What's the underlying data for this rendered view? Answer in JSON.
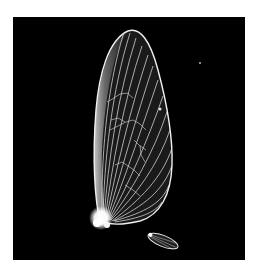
{
  "image": {
    "subject": "Insect wings (forewing and hindwing) photographed on black background",
    "background_color": "#000000",
    "page_color": "#ffffff",
    "wing_color": "#f2f2f2",
    "vein_color": "#e6e6e6",
    "panel": {
      "x": 13,
      "y": 17,
      "width": 232,
      "height": 243
    }
  },
  "labels": {
    "forewing": "forewing",
    "hindwing": "hindwing"
  }
}
